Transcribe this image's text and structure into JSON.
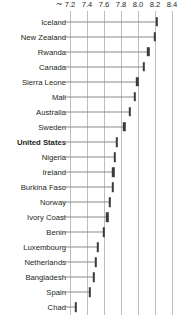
{
  "chart_data": {
    "type": "scatter",
    "title": "",
    "subtitle": "",
    "xlabel": "",
    "ylabel": "",
    "orientation": "horizontal",
    "axis_break_symbol": "~",
    "axis_position": "top",
    "grid": true,
    "gridlines_at": [
      7.2,
      7.4,
      7.6,
      7.8,
      8.0,
      8.2,
      8.4
    ],
    "legend": "none",
    "xlim": [
      7.15,
      8.45
    ],
    "tick_labels": [
      "7.2",
      "7.4",
      "7.6",
      "7.8",
      "8.0",
      "8.2",
      "8.4"
    ],
    "tick_values": [
      7.2,
      7.4,
      7.6,
      7.8,
      8.0,
      8.2,
      8.4
    ],
    "categories": [
      "Iceland",
      "New Zealand",
      "Rwanda",
      "Canada",
      "Sierra Leone",
      "Mali",
      "Australia",
      "Sweden",
      "United States",
      "Nigeria",
      "Ireland",
      "Burkina Faso",
      "Norway",
      "Ivory Coast",
      "Benin",
      "Luxembourg",
      "Netherlands",
      "Bangladesh",
      "Spain",
      "Chad"
    ],
    "values": [
      8.22,
      8.2,
      8.12,
      8.07,
      7.98,
      7.96,
      7.9,
      7.84,
      7.75,
      7.73,
      8.03,
      7.99,
      7.94,
      7.9,
      7.84,
      7.66,
      7.58,
      7.55,
      7.43,
      7.27
    ],
    "rows": [
      {
        "label": "Iceland",
        "value": 8.22,
        "highlight": false
      },
      {
        "label": "New Zealand",
        "value": 8.2,
        "highlight": false
      },
      {
        "label": "Rwanda",
        "value": 8.12,
        "highlight": false
      },
      {
        "label": "Canada",
        "value": 8.07,
        "highlight": false
      },
      {
        "label": "Sierra Leone",
        "value": 7.99,
        "highlight": false
      },
      {
        "label": "Mali",
        "value": 7.96,
        "highlight": false
      },
      {
        "label": "Australia",
        "value": 7.9,
        "highlight": false
      },
      {
        "label": "Sweden",
        "value": 7.84,
        "highlight": false
      },
      {
        "label": "United States",
        "value": 7.75,
        "highlight": true
      },
      {
        "label": "Nigeria",
        "value": 7.73,
        "highlight": false
      },
      {
        "label": "Ireland",
        "value": 7.71,
        "highlight": false
      },
      {
        "label": "Burkina Faso",
        "value": 7.7,
        "highlight": false
      },
      {
        "label": "Norway",
        "value": 7.67,
        "highlight": false
      },
      {
        "label": "Ivory Coast",
        "value": 7.64,
        "highlight": false
      },
      {
        "label": "Benin",
        "value": 7.6,
        "highlight": false
      },
      {
        "label": "Luxembourg",
        "value": 7.53,
        "highlight": false
      },
      {
        "label": "Netherlands",
        "value": 7.5,
        "highlight": false
      },
      {
        "label": "Bangladesh",
        "value": 7.48,
        "highlight": false
      },
      {
        "label": "Spain",
        "value": 7.43,
        "highlight": false
      },
      {
        "label": "Chad",
        "value": 7.27,
        "highlight": false
      }
    ],
    "colors": {
      "marker": "#3b3b3b",
      "gridline": "#bdbdbd",
      "leader_line": "#8a8a8a",
      "text": "#231f20",
      "background": "#ffffff"
    }
  }
}
